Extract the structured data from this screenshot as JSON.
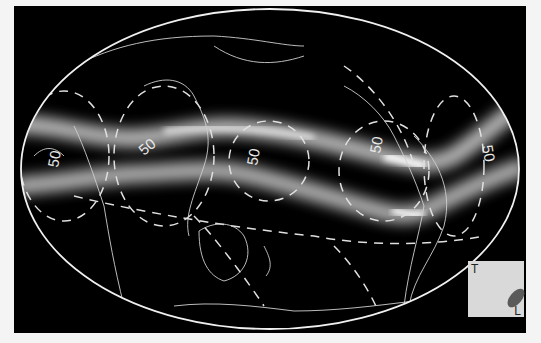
{
  "figure": {
    "contour_label": "50",
    "contour_labels": [
      "50",
      "50",
      "50",
      "50",
      "50"
    ],
    "colors": {
      "background": "#000000",
      "band": "#ffffff",
      "coast": "#d8d8d8",
      "contour": "#e0e0e0",
      "outline": "#f0f0f0",
      "legend_box": "#d9d9d9",
      "legend_blob": "#5a5a5a"
    }
  },
  "legend": {
    "top_label": "T",
    "bottom_label": "L"
  }
}
